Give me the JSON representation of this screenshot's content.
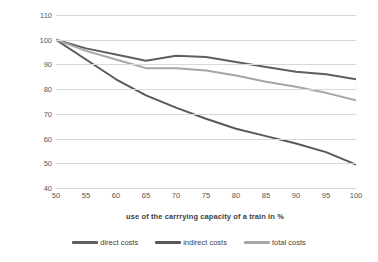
{
  "chart_data": {
    "type": "line",
    "title": "",
    "xlabel": "use of the carrrying capacity of a train in %",
    "ylabel": "costs per TEU in %",
    "xlim": [
      50,
      100
    ],
    "ylim": [
      40,
      110
    ],
    "xticks": [
      50,
      55,
      60,
      65,
      70,
      75,
      80,
      85,
      90,
      95,
      100
    ],
    "yticks": [
      40,
      50,
      60,
      70,
      80,
      90,
      100,
      110
    ],
    "grid": "horizontal",
    "legend_position": "bottom",
    "x": [
      50,
      55,
      60,
      65,
      70,
      75,
      80,
      85,
      90,
      95,
      100
    ],
    "series": [
      {
        "name": "direct costs",
        "color": "#5f5f5f",
        "values": [
          100,
          96.5,
          94,
          91.5,
          93.5,
          93,
          91,
          89,
          87,
          86,
          84
        ]
      },
      {
        "name": "indirect costs",
        "color": "#595959",
        "values": [
          100,
          92,
          84,
          77.5,
          72.5,
          68,
          64,
          61,
          58,
          54.5,
          49.5
        ]
      },
      {
        "name": "total costs",
        "color": "#a6a6a6",
        "values": [
          100,
          95.5,
          92,
          88.5,
          88.5,
          87.5,
          85.5,
          83,
          81,
          78.5,
          75.5
        ]
      }
    ]
  },
  "colors": {
    "grid": "#d9d9d9",
    "text": "#565656",
    "axis_title": "#404040",
    "background": "#ffffff"
  }
}
